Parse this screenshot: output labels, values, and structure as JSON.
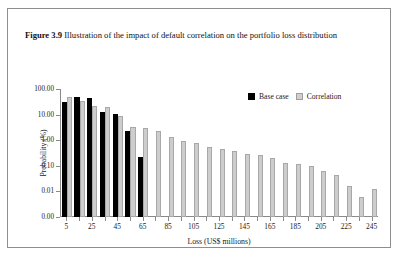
{
  "caption": {
    "label": "Figure 3.9",
    "text": "Illustration of the impact of default correlation on the portfolio loss distribution"
  },
  "legend": {
    "items": [
      {
        "name": "Base case",
        "color": "#000000"
      },
      {
        "name": "Correlation",
        "color": "#cdcdcd"
      }
    ]
  },
  "chart_data": {
    "type": "bar",
    "title": "",
    "xlabel": "Loss (US$ millions)",
    "ylabel": "Probability (%)",
    "yscale": "log",
    "ylim": [
      0.001,
      100
    ],
    "ytick_labels": [
      "100.00",
      "10.00",
      "1.00",
      "0.10",
      "0.01",
      "0.00"
    ],
    "ytick_values": [
      100,
      10,
      1,
      0.1,
      0.01,
      0.001
    ],
    "xtick_labels": [
      "5",
      "25",
      "45",
      "65",
      "85",
      "105",
      "125",
      "145",
      "165",
      "185",
      "205",
      "225",
      "245"
    ],
    "xtick_values": [
      5,
      25,
      45,
      65,
      85,
      105,
      125,
      145,
      165,
      185,
      205,
      225,
      245
    ],
    "xlim": [
      0,
      250
    ],
    "grid": false,
    "legend_position": "top-right",
    "categories": [
      5,
      15,
      25,
      35,
      45,
      55,
      65,
      75,
      85,
      95,
      105,
      115,
      125,
      135,
      145,
      155,
      165,
      175,
      185,
      195,
      205,
      215,
      225,
      235,
      245
    ],
    "series": [
      {
        "name": "Base case",
        "color": "#000000",
        "values": [
          30,
          48,
          45,
          13,
          11,
          2.2,
          0.23,
          null,
          null,
          null,
          null,
          null,
          null,
          null,
          null,
          null,
          null,
          null,
          null,
          null,
          null,
          null,
          null,
          null,
          null
        ]
      },
      {
        "name": "Correlation",
        "color": "#cdcdcd",
        "values": [
          50,
          35,
          22,
          20,
          8.5,
          3.3,
          3.0,
          2.3,
          1.3,
          0.9,
          0.75,
          0.55,
          0.45,
          0.38,
          0.3,
          0.26,
          0.21,
          0.13,
          0.115,
          0.095,
          0.06,
          0.045,
          0.017,
          0.006,
          0.012
        ]
      }
    ]
  }
}
